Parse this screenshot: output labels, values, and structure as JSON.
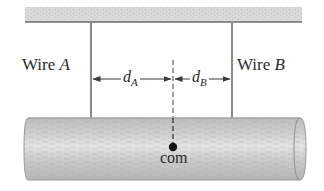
{
  "diagram": {
    "wire_a": {
      "label_prefix": "Wire",
      "label_letter": "A"
    },
    "wire_b": {
      "label_prefix": "Wire",
      "label_letter": "B"
    },
    "distance_a": {
      "symbol": "d",
      "subscript": "A"
    },
    "distance_b": {
      "symbol": "d",
      "subscript": "B"
    },
    "center_of_mass": {
      "label": "com"
    },
    "colors": {
      "ceiling_fill": "#d9d9d9",
      "ceiling_edge": "#6e6e6e",
      "wire": "#8a8a8a",
      "beam_fill": "#c9c9c9",
      "beam_highlight": "#e2e2e2",
      "beam_edge": "#9a9a9a",
      "arrow": "#3a3a3a",
      "com_dot": "#111111",
      "text": "#2b2b2b"
    }
  }
}
